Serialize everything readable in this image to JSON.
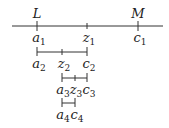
{
  "diagram": {
    "colors": {
      "line": "#333333",
      "text": "#222222"
    },
    "main_line": {
      "top_labels": [
        {
          "text": "L",
          "x": 37
        },
        {
          "text": "M",
          "x": 138
        }
      ],
      "bottom_labels": [
        {
          "base": "a",
          "sub": "1",
          "x": 37
        },
        {
          "base": "z",
          "sub": "1",
          "x": 87
        },
        {
          "base": "c",
          "sub": "1",
          "x": 138
        }
      ]
    },
    "level2": [
      {
        "base": "a",
        "sub": "2"
      },
      {
        "base": "z",
        "sub": "2"
      },
      {
        "base": "c",
        "sub": "2"
      }
    ],
    "level3": [
      {
        "base": "a",
        "sub": "3"
      },
      {
        "base": "z",
        "sub": "3"
      },
      {
        "base": "c",
        "sub": "3"
      }
    ],
    "level4": [
      {
        "base": "a",
        "sub": "4"
      },
      {
        "base": "c",
        "sub": "4"
      }
    ]
  }
}
